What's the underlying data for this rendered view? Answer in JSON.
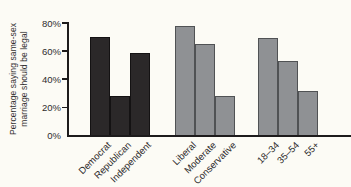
{
  "colors": {
    "background": "#fcfbf5",
    "axis": "#1d1b1c",
    "text": "#2e2b2c",
    "dark_bar": "#2b2829",
    "dark_bar_border": "#141213",
    "gray_bar": "#8f9194",
    "gray_bar_border": "#505254"
  },
  "chart_data": {
    "type": "bar",
    "title": "",
    "ylabel": "Percentage saying same-sex marriage should be legal",
    "ylabel_lines": [
      "Percentage saying same-sex",
      "marriage should be legal"
    ],
    "xlabel": "",
    "ylim": [
      0,
      80
    ],
    "ytick_values": [
      0,
      20,
      40,
      60,
      80
    ],
    "ytick_labels": [
      "0%",
      "20%",
      "40%",
      "60%",
      "80%"
    ],
    "grid": false,
    "legend": "none",
    "groups": [
      {
        "name": "party",
        "bar_color": "#2b2829",
        "bar_border": "#141213",
        "categories": [
          "Democrat",
          "Republican",
          "Independent"
        ],
        "values": [
          70,
          28,
          59
        ]
      },
      {
        "name": "ideology",
        "bar_color": "#8f9194",
        "bar_border": "#505254",
        "categories": [
          "Liberal",
          "Moderate",
          "Conservative"
        ],
        "values": [
          78,
          65,
          28
        ]
      },
      {
        "name": "age",
        "bar_color": "#8f9194",
        "bar_border": "#505254",
        "categories": [
          "18–34",
          "35–54",
          "55+"
        ],
        "values": [
          69,
          53,
          32
        ]
      }
    ]
  }
}
